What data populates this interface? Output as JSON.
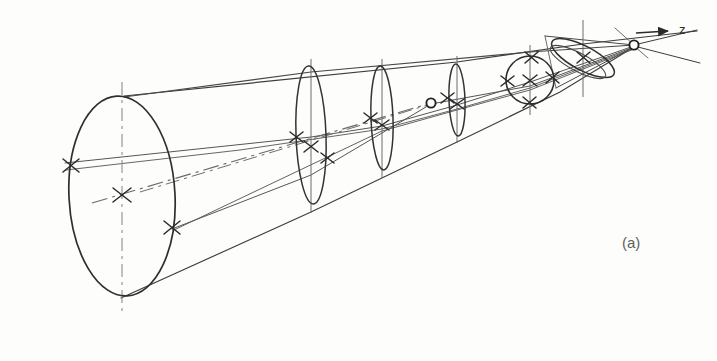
{
  "figure": {
    "kind": "optical-ray-diagram",
    "panel_label": "(a)",
    "axis_label": "z",
    "background_color": "#fdfdfc",
    "ink_color": "#3a3a3a",
    "light_ink_color": "#7a7a7a"
  },
  "diagram_data": {
    "type": "line-drawing",
    "axis": {
      "name": "z",
      "arrow_tip": [
        672,
        31
      ],
      "arrow_tail": [
        636,
        33
      ],
      "direction": "right"
    },
    "elements": [
      {
        "name": "entrance-aperture",
        "shape": "ellipse",
        "cx": 122,
        "cy": 195,
        "rx": 53,
        "ry": 98,
        "rotation": -3,
        "stroke_width": 1.6
      },
      {
        "name": "lens-2",
        "shape": "ellipse",
        "cx": 311,
        "cy": 134,
        "rx": 15,
        "ry": 67,
        "rotation": -2,
        "stroke_width": 1.5
      },
      {
        "name": "lens-3",
        "shape": "ellipse",
        "cx": 382,
        "cy": 118,
        "rx": 11,
        "ry": 51,
        "rotation": -2,
        "stroke_width": 1.5
      },
      {
        "name": "lens-4",
        "shape": "ellipse",
        "cx": 457,
        "cy": 100,
        "rx": 8,
        "ry": 34,
        "rotation": -2,
        "stroke_width": 1.5
      },
      {
        "name": "lens-5-circular",
        "shape": "circle",
        "cx": 530,
        "cy": 80,
        "r": 24,
        "stroke_width": 1.5
      },
      {
        "name": "tilted-element",
        "shape": "ellipse",
        "cx": 583,
        "cy": 58,
        "rx": 34,
        "ry": 12,
        "rotation": 27,
        "stroke_width": 1.5
      }
    ],
    "focal_points": [
      {
        "name": "intermediate-focus",
        "cx": 431,
        "cy": 103,
        "r": 4.5
      },
      {
        "name": "final-focus",
        "cx": 634,
        "cy": 45,
        "r": 4.5
      }
    ],
    "cross_marks": [
      {
        "name": "entrance-center-cross",
        "cx": 122,
        "cy": 194,
        "size": 9
      },
      {
        "name": "entrance-upper-left-cross",
        "cx": 71,
        "cy": 165,
        "size": 8
      },
      {
        "name": "entrance-lower-right-cross",
        "cx": 171,
        "cy": 226,
        "size": 8
      },
      {
        "name": "lens2-center-cross",
        "cx": 311,
        "cy": 147,
        "size": 7
      },
      {
        "name": "lens2-upper-cross",
        "cx": 296,
        "cy": 138,
        "size": 7
      },
      {
        "name": "lens2-lower-cross",
        "cx": 327,
        "cy": 158,
        "size": 7
      },
      {
        "name": "lens3-center-cross",
        "cx": 382,
        "cy": 125,
        "size": 7
      },
      {
        "name": "lens3-upper-cross",
        "cx": 371,
        "cy": 118,
        "size": 7
      },
      {
        "name": "lens3-lower-cross",
        "cx": 393,
        "cy": 131,
        "size": 7
      },
      {
        "name": "lens4-center-cross",
        "cx": 457,
        "cy": 104,
        "size": 7
      },
      {
        "name": "lens4-upper-cross",
        "cx": 448,
        "cy": 99,
        "size": 7
      },
      {
        "name": "lens4-lower-cross",
        "cx": 466,
        "cy": 108,
        "size": 7
      },
      {
        "name": "lens5-left-cross",
        "cx": 508,
        "cy": 82,
        "size": 7
      },
      {
        "name": "lens5-center-cross",
        "cx": 530,
        "cy": 81,
        "size": 7
      },
      {
        "name": "lens5-right-cross",
        "cx": 553,
        "cy": 78,
        "size": 7
      },
      {
        "name": "lens5-top-cross",
        "cx": 531,
        "cy": 58,
        "size": 7
      },
      {
        "name": "lens5-bottom-cross",
        "cx": 529,
        "cy": 103,
        "size": 7
      }
    ],
    "centerlines": [
      {
        "name": "entrance-vertical-centerline",
        "x1": 122,
        "y1": 88,
        "x2": 122,
        "y2": 305,
        "style": "dash-dot"
      },
      {
        "name": "lens2-vertical-centerline",
        "x1": 311,
        "y1": 60,
        "x2": 311,
        "y2": 210,
        "style": "solid-thin"
      },
      {
        "name": "lens3-vertical-centerline",
        "x1": 382,
        "y1": 60,
        "x2": 382,
        "y2": 175,
        "style": "solid-thin"
      },
      {
        "name": "lens4-vertical-centerline",
        "x1": 457,
        "y1": 58,
        "x2": 457,
        "y2": 140,
        "style": "solid-thin"
      },
      {
        "name": "lens5-vertical-centerline",
        "x1": 530,
        "y1": 47,
        "x2": 530,
        "y2": 112,
        "style": "solid-thin"
      },
      {
        "name": "tilt-vertical-centerline",
        "x1": 583,
        "y1": 22,
        "x2": 583,
        "y2": 95,
        "style": "solid-thin"
      },
      {
        "name": "optical-axis-dashed",
        "x1": 130,
        "y1": 196,
        "x2": 431,
        "y2": 103,
        "style": "dash-dot"
      }
    ],
    "ray_bundles": [
      {
        "name": "upper-marginal-ray",
        "points": [
          [
            124,
            97
          ],
          [
            530,
            57
          ],
          [
            634,
            45
          ]
        ]
      },
      {
        "name": "lower-marginal-ray",
        "points": [
          [
            123,
            297
          ],
          [
            311,
            211
          ],
          [
            457,
            141
          ],
          [
            634,
            46
          ]
        ]
      },
      {
        "name": "upper-chief-ray",
        "points": [
          [
            68,
            163
          ],
          [
            311,
            136
          ],
          [
            530,
            81
          ],
          [
            634,
            45
          ]
        ]
      },
      {
        "name": "lower-chief-ray",
        "points": [
          [
            70,
            168
          ],
          [
            382,
            128
          ],
          [
            530,
            85
          ],
          [
            634,
            47
          ]
        ]
      },
      {
        "name": "outer-envelope-top",
        "points": [
          [
            124,
            95
          ],
          [
            457,
            66
          ],
          [
            583,
            44
          ],
          [
            690,
            34
          ]
        ]
      },
      {
        "name": "outer-envelope-bottom",
        "points": [
          [
            173,
            228
          ],
          [
            431,
            104
          ],
          [
            583,
            72
          ],
          [
            690,
            62
          ]
        ]
      }
    ]
  }
}
